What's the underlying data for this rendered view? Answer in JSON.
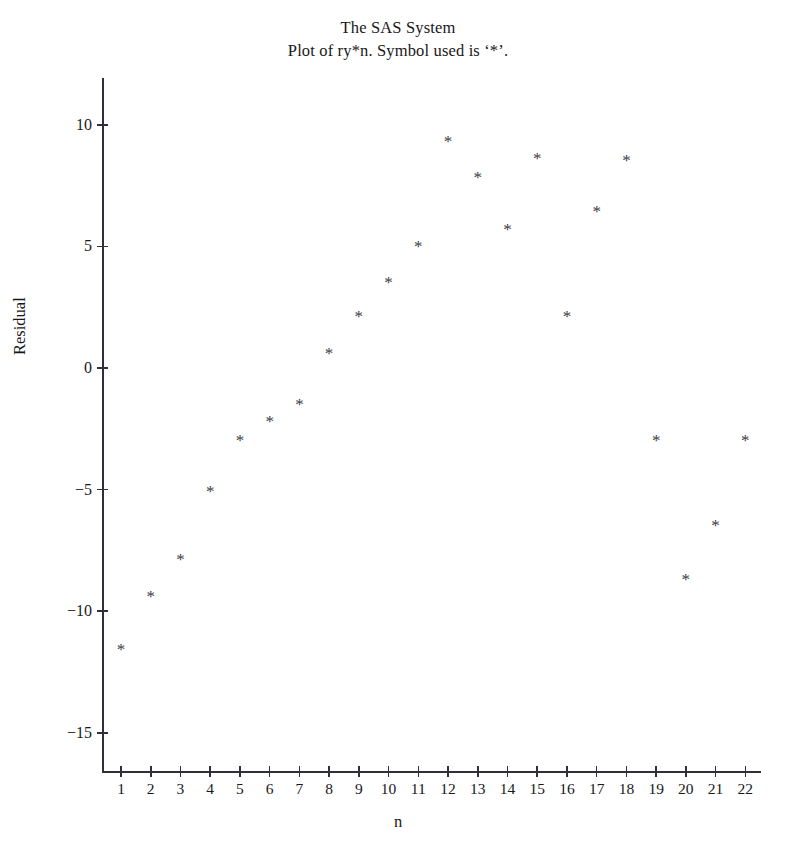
{
  "figure": {
    "title_lines": [
      "The SAS System",
      "Plot of ry*n. Symbol used is ‘*’."
    ]
  },
  "chart_data": {
    "type": "scatter",
    "title": "The SAS System",
    "subtitle": "Plot of ry*n. Symbol used is ‘*’.",
    "xlabel": "n",
    "ylabel": "Residual",
    "marker": "*",
    "grid": false,
    "legend": null,
    "xlim": [
      0.3,
      22.7
    ],
    "ylim": [
      -16.5,
      11.5
    ],
    "xticks": [
      1,
      2,
      3,
      4,
      5,
      6,
      7,
      8,
      9,
      10,
      11,
      12,
      13,
      14,
      15,
      16,
      17,
      18,
      19,
      20,
      21,
      22
    ],
    "yticks": [
      10,
      5,
      0,
      -5,
      -10,
      -15
    ],
    "ytick_labels": [
      "10",
      "5",
      "0",
      "−5",
      "−10",
      "−15"
    ],
    "x": [
      1,
      2,
      3,
      4,
      5,
      6,
      7,
      8,
      9,
      10,
      11,
      12,
      13,
      14,
      15,
      16,
      17,
      18,
      19,
      20,
      21,
      22
    ],
    "y": [
      -11.4,
      -9.2,
      -7.7,
      -4.9,
      -2.8,
      -2.0,
      -1.3,
      0.8,
      2.3,
      3.7,
      5.2,
      9.5,
      8.0,
      5.9,
      8.8,
      2.3,
      6.6,
      8.7,
      -2.8,
      -8.5,
      -6.3,
      -2.8
    ],
    "points": [
      {
        "n": 1,
        "residual": -11.4
      },
      {
        "n": 2,
        "residual": -9.2
      },
      {
        "n": 3,
        "residual": -7.7
      },
      {
        "n": 4,
        "residual": -4.9
      },
      {
        "n": 5,
        "residual": -2.8
      },
      {
        "n": 6,
        "residual": -2.0
      },
      {
        "n": 7,
        "residual": -1.3
      },
      {
        "n": 8,
        "residual": 0.8
      },
      {
        "n": 9,
        "residual": 2.3
      },
      {
        "n": 10,
        "residual": 3.7
      },
      {
        "n": 11,
        "residual": 5.2
      },
      {
        "n": 12,
        "residual": 9.5
      },
      {
        "n": 13,
        "residual": 8.0
      },
      {
        "n": 14,
        "residual": 5.9
      },
      {
        "n": 15,
        "residual": 8.8
      },
      {
        "n": 16,
        "residual": 2.3
      },
      {
        "n": 17,
        "residual": 6.6
      },
      {
        "n": 18,
        "residual": 8.7
      },
      {
        "n": 19,
        "residual": -2.8
      },
      {
        "n": 20,
        "residual": -8.5
      },
      {
        "n": 21,
        "residual": -6.3
      },
      {
        "n": 22,
        "residual": -2.8
      }
    ]
  }
}
